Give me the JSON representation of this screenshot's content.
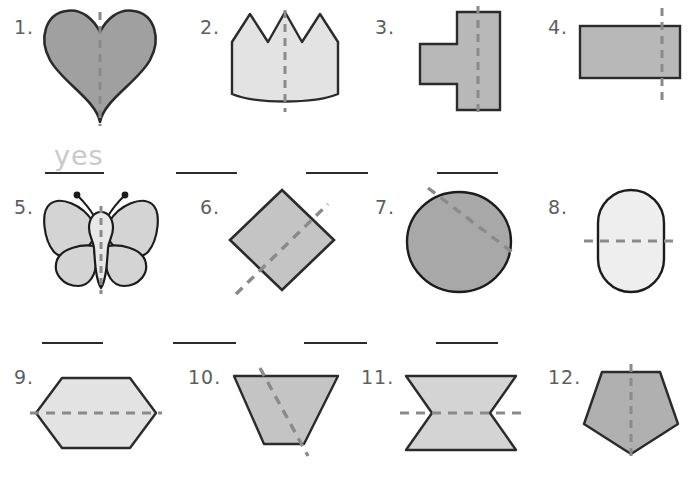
{
  "worksheet": {
    "title": "Lines of Symmetry Worksheet",
    "row_count": 3,
    "column_count": 4,
    "item_count": 12
  },
  "colors": {
    "shape_outline": "#2b2b2b",
    "fill_dark": "#a0a0a0",
    "fill_medium": "#b8b8b8",
    "fill_light": "#d4d4d4",
    "fill_lighter": "#e3e3e3",
    "fill_lightest": "#eeeeee",
    "dashed_line": "#8a8a8a",
    "answer_line": "#2b2b2b",
    "number_text": "#5e5e5e",
    "handwriting": "#c9c9c9",
    "page_background": "#ffffff"
  },
  "items": [
    {
      "number": "1.",
      "shape": "heart",
      "fill": "#a0a0a0",
      "dash_orientation": "vertical",
      "dash_label": "vertical-dashed-line",
      "answer": "yes",
      "answer_filled": true
    },
    {
      "number": "2.",
      "shape": "crown",
      "fill": "#e3e3e3",
      "dash_orientation": "vertical",
      "dash_label": "vertical-dashed-line",
      "answer": "",
      "answer_filled": false
    },
    {
      "number": "3.",
      "shape": "t-polygon",
      "fill": "#b8b8b8",
      "dash_orientation": "vertical",
      "dash_label": "vertical-dashed-line",
      "answer": "",
      "answer_filled": false
    },
    {
      "number": "4.",
      "shape": "rectangle",
      "fill": "#b8b8b8",
      "dash_orientation": "vertical-offset",
      "dash_label": "vertical-dashed-line",
      "answer": "",
      "answer_filled": false
    },
    {
      "number": "5.",
      "shape": "butterfly",
      "fill": "#d4d4d4",
      "dash_orientation": "vertical",
      "dash_label": "vertical-dashed-line",
      "answer": "",
      "answer_filled": false
    },
    {
      "number": "6.",
      "shape": "diamond",
      "fill": "#c4c4c4",
      "dash_orientation": "diagonal",
      "dash_label": "diagonal-dashed-line",
      "answer": "",
      "answer_filled": false
    },
    {
      "number": "7.",
      "shape": "circle",
      "fill": "#a8a8a8",
      "dash_orientation": "diagonal-chord",
      "dash_label": "diagonal-dashed-line",
      "answer": "",
      "answer_filled": false
    },
    {
      "number": "8.",
      "shape": "stadium",
      "fill": "#eeeeee",
      "dash_orientation": "horizontal",
      "dash_label": "horizontal-dashed-line",
      "answer": "",
      "answer_filled": false
    },
    {
      "number": "9.",
      "shape": "hexagon",
      "fill": "#e3e3e3",
      "dash_orientation": "horizontal",
      "dash_label": "horizontal-dashed-line",
      "answer": "",
      "answer_filled": false
    },
    {
      "number": "10.",
      "shape": "inverted-trapezoid",
      "fill": "#c4c4c4",
      "dash_orientation": "diagonal",
      "dash_label": "diagonal-dashed-line",
      "answer": "",
      "answer_filled": false
    },
    {
      "number": "11.",
      "shape": "bowtie",
      "fill": "#d4d4d4",
      "dash_orientation": "horizontal",
      "dash_label": "horizontal-dashed-line",
      "answer": "",
      "answer_filled": false
    },
    {
      "number": "12.",
      "shape": "inverted-pentagon",
      "fill": "#b0b0b0",
      "dash_orientation": "vertical",
      "dash_label": "vertical-dashed-line",
      "answer": "",
      "answer_filled": false
    }
  ]
}
